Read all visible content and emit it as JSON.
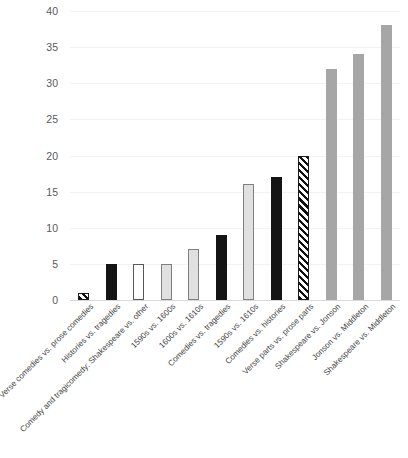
{
  "chart_data": {
    "type": "bar",
    "title": "",
    "subtitle": "",
    "xlabel": "",
    "ylabel": "",
    "ylim": [
      0,
      40
    ],
    "ytick_step": 5,
    "yticks": [
      "0",
      "5",
      "10",
      "15",
      "20",
      "25",
      "30",
      "35",
      "40"
    ],
    "grid": true,
    "legend": "none",
    "categories": [
      "Verse comedies vs. prose comedies",
      "Histories vs. tragedies",
      "Comedy and tragicomedy: Shakespeare vs. other",
      "1590s vs. 1600s",
      "1600s vs. 1610s",
      "Comedies vs. tragedies",
      "1590s vs. 1610s",
      "Comedies vs. histories",
      "Verse parts vs. prose parts",
      "Shakespeare vs. Jonson",
      "Jonson vs. Middleton",
      "Shakespeare vs. Middleton"
    ],
    "values": [
      1,
      5,
      5,
      5,
      7,
      9,
      16,
      17,
      20,
      32,
      34,
      38
    ],
    "bar_styles": [
      "hatch",
      "black",
      "white",
      "ltgray",
      "ltgray",
      "black",
      "ltgray",
      "black",
      "hatch",
      "midgray",
      "midgray",
      "midgray"
    ],
    "colors": {
      "black": "#141414",
      "white": "#ffffff",
      "ltgray": "#e0e0e0",
      "midgray": "#a6a6a6",
      "hatch_stroke": "#111111",
      "gridline": "#f2f2f2",
      "axis": "#d9d9d9",
      "tick_text": "#5a5a5a",
      "category_text": "#3f3f3f"
    }
  }
}
